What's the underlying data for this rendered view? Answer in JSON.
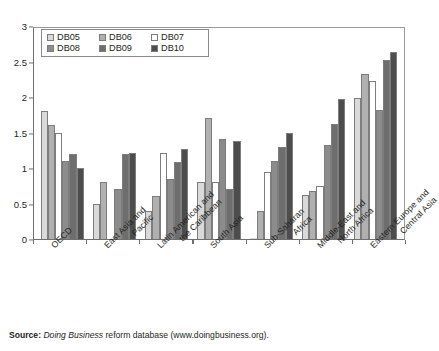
{
  "chart_data": {
    "type": "bar",
    "title": "",
    "xlabel": "",
    "ylabel": "",
    "ylim": [
      0,
      3
    ],
    "ytick_values": [
      0,
      0.5,
      1,
      1.5,
      2,
      2.5,
      3
    ],
    "ytick_labels": [
      "0",
      "0.5",
      "1",
      "1.5",
      "2",
      "2.5",
      "3"
    ],
    "grid": false,
    "legend_position": "top-left",
    "categories": [
      "OECD",
      "East Asia and Pacific",
      "Latin American and the Caribbean",
      "South Asia",
      "Sub-Saharan Africa",
      "Middle-East and North Africa",
      "Eastern Europe and Central Asia"
    ],
    "category_lines": [
      [
        "OECD",
        ""
      ],
      [
        "East Asia and",
        "Pacific"
      ],
      [
        "Latin American and",
        "the Caribbean"
      ],
      [
        "South Asia",
        ""
      ],
      [
        "Sub-Saharan",
        "Africa"
      ],
      [
        "Middle-East and",
        "North Africa"
      ],
      [
        "Eastern Europe and",
        "Central Asia"
      ]
    ],
    "series": [
      {
        "name": "DB05",
        "color": "#d9d9d9",
        "values": [
          1.8,
          0.5,
          0.4,
          0.8,
          0.0,
          0.62,
          1.98
        ]
      },
      {
        "name": "DB06",
        "color": "#b0b0b0",
        "values": [
          1.6,
          0.8,
          0.6,
          1.7,
          0.4,
          0.67,
          2.32
        ]
      },
      {
        "name": "DB07",
        "color": "#ffffff",
        "values": [
          1.5,
          0.0,
          1.21,
          0.8,
          0.95,
          0.75,
          2.22
        ]
      },
      {
        "name": "DB08",
        "color": "#8c8c8c",
        "values": [
          1.1,
          0.7,
          0.84,
          1.41,
          1.1,
          1.32,
          1.82
        ]
      },
      {
        "name": "DB09",
        "color": "#6e6e6e",
        "values": [
          1.2,
          1.2,
          1.09,
          0.7,
          1.3,
          1.62,
          2.52
        ]
      },
      {
        "name": "DB10",
        "color": "#4d4d4d",
        "values": [
          1.0,
          1.21,
          1.27,
          1.38,
          1.5,
          1.97,
          2.64
        ]
      }
    ]
  },
  "legend": {
    "items": [
      {
        "label": "DB05"
      },
      {
        "label": "DB06"
      },
      {
        "label": "DB07"
      },
      {
        "label": "DB08"
      },
      {
        "label": "DB09"
      },
      {
        "label": "DB10"
      }
    ]
  },
  "source_note": {
    "label": "Source:",
    "italic_part": "Doing Business",
    "rest": " reform database (www.doingbusiness.org)."
  }
}
